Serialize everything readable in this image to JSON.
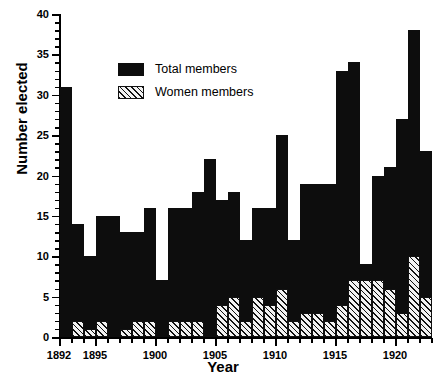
{
  "chart_data": {
    "type": "bar",
    "title": "",
    "xlabel": "Year",
    "ylabel": "Number elected",
    "xlim": [
      1892,
      1923
    ],
    "ylim": [
      0,
      40
    ],
    "ytick_step": 5,
    "ytick_minor_step": 1,
    "xtick_step": 5,
    "xtick_minor_step": 1,
    "grid": false,
    "legend_position": "upper-center",
    "x_tick_labels": [
      "1892",
      "1895",
      "1900",
      "1905",
      "1910",
      "1915",
      "1920"
    ],
    "x_tick_values": [
      1892,
      1895,
      1900,
      1905,
      1910,
      1915,
      1920
    ],
    "y_tick_labels": [
      "0",
      "5",
      "10",
      "15",
      "20",
      "25",
      "30",
      "35",
      "40"
    ],
    "y_tick_values": [
      0,
      5,
      10,
      15,
      20,
      25,
      30,
      35,
      40
    ],
    "categories": [
      1892,
      1893,
      1894,
      1895,
      1896,
      1897,
      1898,
      1899,
      1900,
      1901,
      1902,
      1903,
      1904,
      1905,
      1906,
      1907,
      1908,
      1909,
      1910,
      1911,
      1912,
      1913,
      1914,
      1915,
      1916,
      1917,
      1918,
      1919,
      1920,
      1921,
      1922
    ],
    "series": [
      {
        "name": "Total members",
        "color": "#0d0d0d",
        "fill": "solid",
        "values": [
          31,
          14,
          10,
          15,
          15,
          13,
          13,
          16,
          7,
          16,
          16,
          18,
          22,
          17,
          18,
          12,
          16,
          16,
          25,
          12,
          19,
          19,
          19,
          33,
          34,
          9,
          20,
          21,
          27,
          38,
          23
        ]
      },
      {
        "name": "Women members",
        "color": "#f2f2f2",
        "fill": "hatched",
        "values": [
          0,
          2,
          1,
          2,
          0,
          1,
          2,
          2,
          0,
          2,
          2,
          2,
          0,
          4,
          5,
          2,
          5,
          4,
          6,
          2,
          3,
          3,
          2,
          4,
          7,
          7,
          7,
          6,
          3,
          10,
          5
        ]
      }
    ]
  },
  "legend": {
    "items": [
      {
        "label": "Total members",
        "style": "solid"
      },
      {
        "label": "Women members",
        "style": "hatched"
      }
    ]
  }
}
